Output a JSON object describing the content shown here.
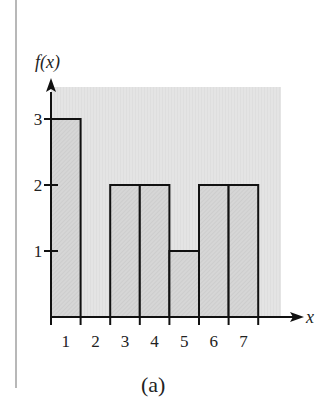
{
  "chart_data": {
    "type": "bar",
    "title": "",
    "caption": "(a)",
    "xlabel": "x",
    "ylabel": "f(x)",
    "categories": [
      "1",
      "2",
      "3",
      "4",
      "5",
      "6",
      "7"
    ],
    "values": [
      3,
      0,
      2,
      2,
      1,
      2,
      2
    ],
    "yticks": [
      "1",
      "2",
      "3"
    ],
    "xticks": [
      "1",
      "2",
      "3",
      "4",
      "5",
      "6",
      "7"
    ],
    "ylim": [
      0,
      3.5
    ],
    "xlim": [
      0.5,
      7.8
    ],
    "grid": false,
    "legend": null,
    "bar_fill": "#d4d4d4",
    "background_fill": "#e2e2e2",
    "edge_color": "#111111"
  }
}
